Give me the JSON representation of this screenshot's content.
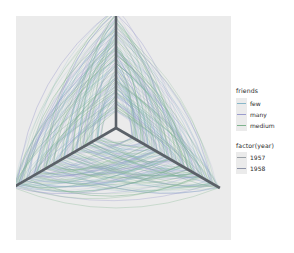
{
  "figure": {
    "type": "hive-plot",
    "panel_background": "#ebebeb",
    "page_background": "#ffffff",
    "axis_color": "#5b6168",
    "axis_count": 3
  },
  "legends": [
    {
      "name": "friends",
      "title": "friends",
      "items": [
        {
          "label": "few",
          "color": "#88b7c9"
        },
        {
          "label": "many",
          "color": "#9a9ccd"
        },
        {
          "label": "medium",
          "color": "#7fb38e"
        }
      ]
    },
    {
      "name": "factor(year)",
      "title": "factor(year)",
      "items": [
        {
          "label": "1957",
          "color": "#9aa0a6"
        },
        {
          "label": "1958",
          "color": "#8e94a8"
        }
      ]
    }
  ],
  "chart_data": {
    "type": "line",
    "title": "",
    "xlabel": "",
    "ylabel": "",
    "grid": false,
    "legend_position": "right",
    "axes": [
      {
        "name": "axis-top",
        "angle_deg": 90,
        "length": 120
      },
      {
        "name": "axis-lower-left",
        "angle_deg": 210,
        "length": 120
      },
      {
        "name": "axis-lower-right",
        "angle_deg": 330,
        "length": 120
      }
    ],
    "series": [
      {
        "name": "few",
        "color": "#88b7c9",
        "edge_count": 120
      },
      {
        "name": "many",
        "color": "#9a9ccd",
        "edge_count": 120
      },
      {
        "name": "medium",
        "color": "#7fb38e",
        "edge_count": 120
      }
    ],
    "categories": [
      "few",
      "many",
      "medium"
    ],
    "values": [
      120,
      120,
      120
    ]
  }
}
